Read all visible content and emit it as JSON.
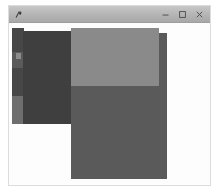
{
  "window": {
    "title": "",
    "icon": "app-icon",
    "frame_color": "#dcdcdc",
    "client_background": "#fdfdfd",
    "titlebar_color": "#b4b4b4",
    "controls": [
      {
        "name": "minimize",
        "glyph": "minimize-icon",
        "label": ""
      },
      {
        "name": "maximize",
        "glyph": "maximize-icon",
        "label": ""
      },
      {
        "name": "close",
        "glyph": "close-icon",
        "label": ""
      }
    ]
  },
  "canvas": {
    "background": "#fdfdfd",
    "blocks": [
      {
        "name": "left-strip-upper",
        "color": "#474747",
        "x": 3,
        "y": 5,
        "w": 12,
        "h": 24
      },
      {
        "name": "left-strip-mid",
        "color": "#5a5a5a",
        "x": 3,
        "y": 29,
        "w": 12,
        "h": 16
      },
      {
        "name": "left-strip-lower",
        "color": "#474747",
        "x": 3,
        "y": 45,
        "w": 12,
        "h": 28
      },
      {
        "name": "left-strip-bottom",
        "color": "#6e6e6e",
        "x": 3,
        "y": 73,
        "w": 12,
        "h": 28
      },
      {
        "name": "dark-panel",
        "color": "#3f3f3f",
        "x": 14,
        "y": 8,
        "w": 57,
        "h": 93
      },
      {
        "name": "light-panel",
        "color": "#8a8a8a",
        "x": 62,
        "y": 5,
        "w": 88,
        "h": 58
      },
      {
        "name": "main-panel",
        "color": "#5a5a5a",
        "x": 62,
        "y": 10,
        "w": 96,
        "h": 146
      }
    ],
    "nub": {
      "name": "left-strip-nub",
      "color": "#8c8c8c",
      "x": 7,
      "y": 30,
      "w": 5,
      "h": 6
    }
  },
  "colors": {
    "accent": "#5a5a5a",
    "highlight": "#8a8a8a",
    "shadow": "#3f3f3f"
  }
}
